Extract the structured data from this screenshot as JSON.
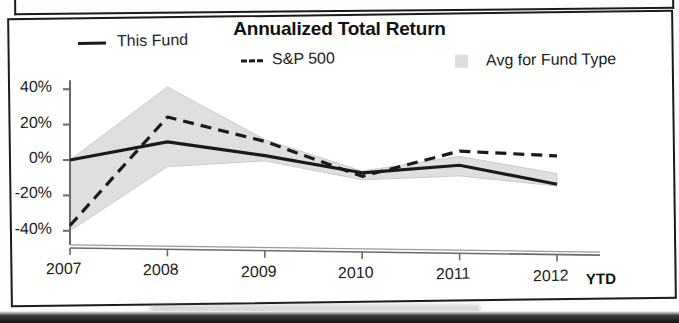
{
  "chart_data": {
    "type": "line",
    "title": "Annualized Total Return",
    "xlabel": "",
    "ylabel": "",
    "categories": [
      "2007",
      "2008",
      "2009",
      "2010",
      "2011",
      "2012"
    ],
    "x_axis_suffix": "YTD",
    "ylim": [
      -45,
      45
    ],
    "ytick_labels": [
      "40%",
      "20%",
      "0%",
      "-20%",
      "-40%"
    ],
    "ytick_values": [
      40,
      20,
      0,
      -20,
      -40
    ],
    "grid": false,
    "legend_position": "top",
    "series": [
      {
        "name": "This Fund",
        "style": "solid",
        "color": "#1a1a1a",
        "values": [
          0,
          11,
          4,
          -5,
          0,
          -10
        ]
      },
      {
        "name": "S&P 500",
        "style": "dashed",
        "color": "#1a1a1a",
        "values": [
          -37,
          25,
          12,
          -7,
          8,
          6
        ]
      },
      {
        "name": "Avg for Fund Type",
        "style": "band",
        "color": "#dedede",
        "upper": [
          0,
          42,
          13,
          -4,
          5,
          -4
        ],
        "lower": [
          -40,
          -3,
          1,
          -9,
          -6,
          -11
        ]
      }
    ]
  },
  "legend": {
    "this_fund": "This Fund",
    "sp500": "S&P 500",
    "avg_fund_type": "Avg for Fund Type"
  },
  "colors": {
    "line": "#1a1a1a",
    "band": "#dedede",
    "axis": "#6a6a6a",
    "frame": "#1b1b1b"
  }
}
